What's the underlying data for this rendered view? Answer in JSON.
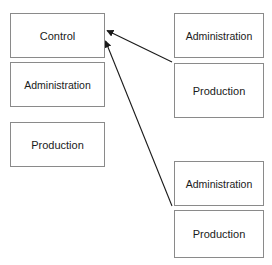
{
  "diagram": {
    "type": "block-diagram",
    "background_color": "#ffffff",
    "box_border_color": "#8a8a8a",
    "text_color": "#1a1a1a",
    "arrow_color": "#1a1a1a",
    "partial_top_text": "",
    "groups": [
      {
        "id": "left-group",
        "position": "left",
        "nodes": [
          {
            "id": "control-left",
            "label": "Control"
          },
          {
            "id": "administration-left",
            "label": "Administration"
          },
          {
            "id": "production-left",
            "label": "Production"
          }
        ]
      },
      {
        "id": "top-right-group",
        "position": "top-right",
        "nodes": [
          {
            "id": "administration-top-right",
            "label": "Administration"
          },
          {
            "id": "production-top-right",
            "label": "Production"
          }
        ]
      },
      {
        "id": "bottom-right-group",
        "position": "bottom-right",
        "nodes": [
          {
            "id": "administration-bottom-right",
            "label": "Administration"
          },
          {
            "id": "production-bottom-right",
            "label": "Production"
          }
        ]
      }
    ],
    "arrows": [
      {
        "id": "arrow-top-right-to-control",
        "from": "top-right-group",
        "to": "control-left",
        "direction": "to-control",
        "head": "filled-triangle"
      },
      {
        "id": "arrow-bottom-right-to-control",
        "from": "bottom-right-group",
        "to": "control-left",
        "direction": "to-control",
        "head": "filled-triangle"
      }
    ]
  }
}
